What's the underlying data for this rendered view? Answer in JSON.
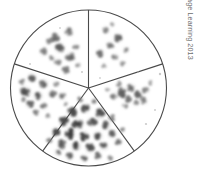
{
  "figure": {
    "name": "petri-dish-sectored-colony-count",
    "background_color": "#ffffff",
    "outline_color": "#4a4a4a",
    "colony_color": "#5b5b5b",
    "colony_dark_color": "#2e2e2e",
    "colony_light_color": "#9a9a9a"
  },
  "plate": {
    "center_x": 88.5,
    "center_y": 88.0,
    "radius": 78.0,
    "outline_width": 1.1,
    "sector_count": 5,
    "divider_angles_deg": [
      270,
      342,
      54,
      126,
      198
    ]
  },
  "sectors": [
    {
      "id": "sector-top-left",
      "label": "top-left",
      "start_angle_deg": 198,
      "end_angle_deg": 270,
      "colony_count": 11,
      "density": "moderate",
      "colonies": [
        {
          "x": 55,
          "y": 38,
          "r": 4.4,
          "tone": 0.55
        },
        {
          "x": 69,
          "y": 32,
          "r": 4.0,
          "tone": 0.5
        },
        {
          "x": 60,
          "y": 48,
          "r": 4.6,
          "tone": 0.62
        },
        {
          "x": 44,
          "y": 52,
          "r": 3.8,
          "tone": 0.45
        },
        {
          "x": 70,
          "y": 57,
          "r": 4.2,
          "tone": 0.58
        },
        {
          "x": 58,
          "y": 62,
          "r": 3.4,
          "tone": 0.42
        },
        {
          "x": 76,
          "y": 47,
          "r": 3.0,
          "tone": 0.38
        },
        {
          "x": 49,
          "y": 41,
          "r": 3.2,
          "tone": 0.44
        },
        {
          "x": 66,
          "y": 70,
          "r": 3.6,
          "tone": 0.48
        },
        {
          "x": 78,
          "y": 65,
          "r": 2.6,
          "tone": 0.32
        },
        {
          "x": 52,
          "y": 58,
          "r": 2.8,
          "tone": 0.35
        }
      ]
    },
    {
      "id": "sector-top-right",
      "label": "top-right",
      "start_angle_deg": 270,
      "end_angle_deg": 342,
      "colony_count": 9,
      "density": "moderate",
      "colonies": [
        {
          "x": 106,
          "y": 30,
          "r": 3.4,
          "tone": 0.42
        },
        {
          "x": 118,
          "y": 38,
          "r": 4.4,
          "tone": 0.58
        },
        {
          "x": 110,
          "y": 45,
          "r": 3.6,
          "tone": 0.48
        },
        {
          "x": 100,
          "y": 53,
          "r": 4.0,
          "tone": 0.52
        },
        {
          "x": 115,
          "y": 57,
          "r": 3.2,
          "tone": 0.4
        },
        {
          "x": 126,
          "y": 50,
          "r": 3.0,
          "tone": 0.38
        },
        {
          "x": 122,
          "y": 63,
          "r": 2.8,
          "tone": 0.34
        },
        {
          "x": 104,
          "y": 66,
          "r": 2.6,
          "tone": 0.32
        },
        {
          "x": 112,
          "y": 24,
          "r": 2.4,
          "tone": 0.3
        }
      ]
    },
    {
      "id": "sector-right",
      "label": "right",
      "start_angle_deg": 342,
      "end_angle_deg": 54,
      "colony_count": 12,
      "density": "moderate-clustered",
      "colonies": [
        {
          "x": 122,
          "y": 92,
          "r": 4.6,
          "tone": 0.6
        },
        {
          "x": 131,
          "y": 88,
          "r": 4.0,
          "tone": 0.55
        },
        {
          "x": 139,
          "y": 95,
          "r": 4.2,
          "tone": 0.58
        },
        {
          "x": 128,
          "y": 99,
          "r": 3.8,
          "tone": 0.5
        },
        {
          "x": 114,
          "y": 96,
          "r": 3.4,
          "tone": 0.46
        },
        {
          "x": 146,
          "y": 90,
          "r": 3.2,
          "tone": 0.42
        },
        {
          "x": 136,
          "y": 103,
          "r": 3.0,
          "tone": 0.4
        },
        {
          "x": 144,
          "y": 101,
          "r": 3.4,
          "tone": 0.45
        },
        {
          "x": 119,
          "y": 84,
          "r": 2.8,
          "tone": 0.36
        },
        {
          "x": 150,
          "y": 83,
          "r": 2.4,
          "tone": 0.3
        },
        {
          "x": 125,
          "y": 106,
          "r": 2.6,
          "tone": 0.33
        },
        {
          "x": 108,
          "y": 90,
          "r": 2.2,
          "tone": 0.28
        }
      ]
    },
    {
      "id": "sector-bottom",
      "label": "bottom",
      "start_angle_deg": 54,
      "end_angle_deg": 126,
      "colony_count": 28,
      "density": "high",
      "colonies": [
        {
          "x": 72,
          "y": 112,
          "r": 4.8,
          "tone": 0.72
        },
        {
          "x": 86,
          "y": 108,
          "r": 4.4,
          "tone": 0.68
        },
        {
          "x": 100,
          "y": 114,
          "r": 4.6,
          "tone": 0.7
        },
        {
          "x": 64,
          "y": 122,
          "r": 4.6,
          "tone": 0.72
        },
        {
          "x": 78,
          "y": 124,
          "r": 4.8,
          "tone": 0.76
        },
        {
          "x": 92,
          "y": 122,
          "r": 4.4,
          "tone": 0.66
        },
        {
          "x": 106,
          "y": 126,
          "r": 4.2,
          "tone": 0.64
        },
        {
          "x": 56,
          "y": 132,
          "r": 4.4,
          "tone": 0.7
        },
        {
          "x": 70,
          "y": 134,
          "r": 4.8,
          "tone": 0.78
        },
        {
          "x": 84,
          "y": 136,
          "r": 4.6,
          "tone": 0.74
        },
        {
          "x": 98,
          "y": 136,
          "r": 4.4,
          "tone": 0.68
        },
        {
          "x": 112,
          "y": 134,
          "r": 4.0,
          "tone": 0.6
        },
        {
          "x": 62,
          "y": 144,
          "r": 4.2,
          "tone": 0.66
        },
        {
          "x": 76,
          "y": 146,
          "r": 4.6,
          "tone": 0.74
        },
        {
          "x": 90,
          "y": 148,
          "r": 4.4,
          "tone": 0.7
        },
        {
          "x": 104,
          "y": 146,
          "r": 4.0,
          "tone": 0.62
        },
        {
          "x": 118,
          "y": 142,
          "r": 3.4,
          "tone": 0.52
        },
        {
          "x": 70,
          "y": 156,
          "r": 3.8,
          "tone": 0.58
        },
        {
          "x": 84,
          "y": 158,
          "r": 3.6,
          "tone": 0.56
        },
        {
          "x": 98,
          "y": 156,
          "r": 3.4,
          "tone": 0.52
        },
        {
          "x": 112,
          "y": 118,
          "r": 3.2,
          "tone": 0.48
        },
        {
          "x": 50,
          "y": 140,
          "r": 3.0,
          "tone": 0.46
        },
        {
          "x": 58,
          "y": 152,
          "r": 3.2,
          "tone": 0.48
        },
        {
          "x": 80,
          "y": 100,
          "r": 3.0,
          "tone": 0.46
        },
        {
          "x": 94,
          "y": 101,
          "r": 2.8,
          "tone": 0.42
        },
        {
          "x": 122,
          "y": 130,
          "r": 2.6,
          "tone": 0.38
        },
        {
          "x": 110,
          "y": 158,
          "r": 2.6,
          "tone": 0.38
        },
        {
          "x": 66,
          "y": 104,
          "r": 2.4,
          "tone": 0.34
        }
      ]
    },
    {
      "id": "sector-left",
      "label": "left",
      "start_angle_deg": 126,
      "end_angle_deg": 198,
      "colony_count": 13,
      "density": "moderate-clustered",
      "colonies": [
        {
          "x": 32,
          "y": 78,
          "r": 4.4,
          "tone": 0.6
        },
        {
          "x": 44,
          "y": 84,
          "r": 4.2,
          "tone": 0.58
        },
        {
          "x": 26,
          "y": 92,
          "r": 4.8,
          "tone": 0.7
        },
        {
          "x": 38,
          "y": 96,
          "r": 4.4,
          "tone": 0.62
        },
        {
          "x": 52,
          "y": 94,
          "r": 3.8,
          "tone": 0.52
        },
        {
          "x": 62,
          "y": 96,
          "r": 3.6,
          "tone": 0.5
        },
        {
          "x": 30,
          "y": 104,
          "r": 4.0,
          "tone": 0.56
        },
        {
          "x": 44,
          "y": 106,
          "r": 3.4,
          "tone": 0.46
        },
        {
          "x": 22,
          "y": 82,
          "r": 3.0,
          "tone": 0.42
        },
        {
          "x": 36,
          "y": 112,
          "r": 3.2,
          "tone": 0.44
        },
        {
          "x": 56,
          "y": 84,
          "r": 2.8,
          "tone": 0.38
        },
        {
          "x": 24,
          "y": 100,
          "r": 2.6,
          "tone": 0.36
        },
        {
          "x": 48,
          "y": 116,
          "r": 2.4,
          "tone": 0.32
        }
      ]
    }
  ],
  "stray_specks": [
    {
      "x": 160,
      "y": 74,
      "r": 1.2,
      "tone": 0.25
    },
    {
      "x": 155,
      "y": 110,
      "r": 1.0,
      "tone": 0.22
    },
    {
      "x": 146,
      "y": 124,
      "r": 1.1,
      "tone": 0.24
    },
    {
      "x": 100,
      "y": 78,
      "r": 0.9,
      "tone": 0.2
    },
    {
      "x": 30,
      "y": 64,
      "r": 1.0,
      "tone": 0.22
    },
    {
      "x": 82,
      "y": 72,
      "r": 1.0,
      "tone": 0.24
    },
    {
      "x": 138,
      "y": 72,
      "r": 0.9,
      "tone": 0.2
    },
    {
      "x": 60,
      "y": 28,
      "r": 0.9,
      "tone": 0.2
    }
  ],
  "copyright": {
    "text": "© Cengage Learning 2013",
    "color": "#6d6d6d",
    "orientation": "vertical-right"
  }
}
